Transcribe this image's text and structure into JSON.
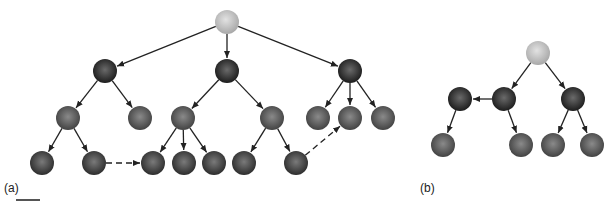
{
  "figure": {
    "panels": [
      {
        "label": "(a)",
        "label_pos": [
          4,
          190
        ],
        "nodes": [
          {
            "id": "a0",
            "x": 227,
            "y": 22,
            "type": "root"
          },
          {
            "id": "a1",
            "x": 105,
            "y": 71,
            "type": "inner"
          },
          {
            "id": "a2",
            "x": 227,
            "y": 71,
            "type": "inner"
          },
          {
            "id": "a3",
            "x": 350,
            "y": 71,
            "type": "inner"
          },
          {
            "id": "a4",
            "x": 68,
            "y": 118,
            "type": "mid"
          },
          {
            "id": "a5",
            "x": 140,
            "y": 118,
            "type": "mid"
          },
          {
            "id": "a6",
            "x": 183,
            "y": 118,
            "type": "mid"
          },
          {
            "id": "a7",
            "x": 272,
            "y": 118,
            "type": "mid"
          },
          {
            "id": "a8",
            "x": 318,
            "y": 118,
            "type": "mid"
          },
          {
            "id": "a9",
            "x": 350,
            "y": 118,
            "type": "mid"
          },
          {
            "id": "a10",
            "x": 383,
            "y": 118,
            "type": "mid"
          },
          {
            "id": "a11",
            "x": 42,
            "y": 163,
            "type": "leaf"
          },
          {
            "id": "a12",
            "x": 94,
            "y": 163,
            "type": "leaf"
          },
          {
            "id": "a13",
            "x": 153,
            "y": 163,
            "type": "leaf"
          },
          {
            "id": "a14",
            "x": 184,
            "y": 163,
            "type": "leaf"
          },
          {
            "id": "a15",
            "x": 214,
            "y": 163,
            "type": "leaf"
          },
          {
            "id": "a16",
            "x": 244,
            "y": 163,
            "type": "leaf"
          },
          {
            "id": "a17",
            "x": 296,
            "y": 163,
            "type": "leaf"
          }
        ],
        "edges": [
          [
            "a0",
            "a1",
            "solid"
          ],
          [
            "a0",
            "a2",
            "solid"
          ],
          [
            "a0",
            "a3",
            "solid"
          ],
          [
            "a1",
            "a4",
            "solid"
          ],
          [
            "a1",
            "a5",
            "solid"
          ],
          [
            "a2",
            "a6",
            "solid"
          ],
          [
            "a2",
            "a7",
            "solid"
          ],
          [
            "a3",
            "a8",
            "solid"
          ],
          [
            "a3",
            "a9",
            "solid"
          ],
          [
            "a3",
            "a10",
            "solid"
          ],
          [
            "a4",
            "a11",
            "solid"
          ],
          [
            "a4",
            "a12",
            "solid"
          ],
          [
            "a6",
            "a13",
            "solid"
          ],
          [
            "a6",
            "a14",
            "solid"
          ],
          [
            "a6",
            "a15",
            "solid"
          ],
          [
            "a7",
            "a16",
            "solid"
          ],
          [
            "a7",
            "a17",
            "solid"
          ],
          [
            "a12",
            "a13",
            "dashed"
          ],
          [
            "a17",
            "a9",
            "dashed"
          ]
        ]
      },
      {
        "label": "(b)",
        "label_pos": [
          420,
          190
        ],
        "nodes": [
          {
            "id": "b0",
            "x": 538,
            "y": 53,
            "type": "root"
          },
          {
            "id": "b1",
            "x": 460,
            "y": 99,
            "type": "inner"
          },
          {
            "id": "b2",
            "x": 504,
            "y": 99,
            "type": "inner"
          },
          {
            "id": "b3",
            "x": 573,
            "y": 99,
            "type": "inner"
          },
          {
            "id": "b4",
            "x": 443,
            "y": 145,
            "type": "mid"
          },
          {
            "id": "b5",
            "x": 521,
            "y": 145,
            "type": "mid"
          },
          {
            "id": "b6",
            "x": 553,
            "y": 145,
            "type": "mid"
          },
          {
            "id": "b7",
            "x": 592,
            "y": 145,
            "type": "mid"
          }
        ],
        "edges": [
          [
            "b0",
            "b2",
            "solid"
          ],
          [
            "b0",
            "b3",
            "solid"
          ],
          [
            "b2",
            "b1",
            "solid"
          ],
          [
            "b1",
            "b4",
            "solid"
          ],
          [
            "b2",
            "b5",
            "solid"
          ],
          [
            "b3",
            "b6",
            "solid"
          ],
          [
            "b3",
            "b7",
            "solid"
          ]
        ]
      }
    ],
    "colors": {
      "root": "#c4c4c4",
      "inner": "#2a2a2a",
      "mid": "#5a5a5a",
      "leaf": "#404040",
      "edge": "#222222"
    },
    "node_radius": 12
  }
}
